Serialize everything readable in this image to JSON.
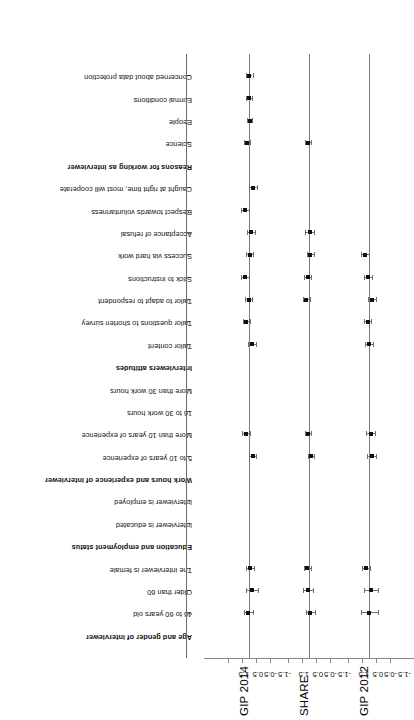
{
  "figure": {
    "orientation": "rotated-90",
    "panels": [
      {
        "title": "GIP 2014"
      },
      {
        "title": "SHARE"
      },
      {
        "title": "GIP 2012"
      }
    ],
    "axis_ticks": [
      "-1.5",
      "-0.5",
      "0.5",
      "1.5"
    ]
  },
  "legend": {
    "groups": [
      {
        "header": "Age and gender of interviewer",
        "items": [
          "46 to 60 years old",
          "Older than 60",
          "The interviewer is female"
        ]
      },
      {
        "header": "Education and employment status",
        "items": [
          "Interviewer is educated",
          "Interviewer is employed"
        ]
      },
      {
        "header": "Work hours and experience of interviewer",
        "items": [
          "5 to 10 years of experience",
          "More than 10 years of experience",
          "16 to 30 work hours",
          "More than 30 work hours"
        ]
      },
      {
        "header": "Interviewers attitudes",
        "items": [
          "Tailor content",
          "Tailor questions to shorten survey",
          "Tailor to adapt to respondent",
          "Stick to instructions",
          "Success via hard work",
          "Acceptance of refusal",
          "Respect towards voluntariness",
          "Caught at right time, most will cooperate"
        ]
      },
      {
        "header": "Reasons for working as interviewer",
        "items": [
          "Science",
          "People",
          "Formal conditions",
          "Concerned about data protection"
        ]
      }
    ]
  },
  "chart_data": {
    "type": "scatter",
    "title": "",
    "xlabel": "",
    "ylabel": "",
    "ylim": [
      -2.0,
      2.0
    ],
    "yticks": [
      -1.5,
      -0.5,
      0.5,
      1.5
    ],
    "grid": false,
    "legend_position": "none",
    "categories": [
      "46 to 60 years old",
      "Older than 60",
      "The interviewer is female",
      "Interviewer is educated",
      "Interviewer is employed",
      "5 to 10 years of experience",
      "More than 10 years of experience",
      "16 to 30 work hours",
      "More than 30 work hours",
      "Tailor content",
      "Tailor questions to shorten survey",
      "Tailor to adapt to respondent",
      "Stick to instructions",
      "Success via hard work",
      "Acceptance of refusal",
      "Respect towards voluntariness",
      "Caught at right time, most will cooperate",
      "Science",
      "People",
      "Formal conditions",
      "Concerned about data protection"
    ],
    "series": [
      {
        "name": "GIP 2014",
        "values": [
          0.05,
          -0.22,
          -0.09,
          null,
          null,
          -0.25,
          0.22,
          null,
          null,
          -0.24,
          0.18,
          0.02,
          0.3,
          -0.06,
          -0.12,
          0.26,
          -0.3,
          0.12,
          -0.04,
          -0.02,
          -0.03
        ],
        "ci_low": [
          -0.28,
          -0.62,
          -0.38,
          null,
          null,
          -0.52,
          -0.05,
          null,
          null,
          -0.52,
          -0.08,
          -0.24,
          0.02,
          -0.3,
          -0.4,
          -0.02,
          -0.6,
          -0.1,
          -0.22,
          -0.22,
          -0.25
        ],
        "ci_high": [
          0.38,
          0.18,
          0.2,
          null,
          null,
          0.02,
          0.49,
          null,
          null,
          0.04,
          0.44,
          0.28,
          0.58,
          0.18,
          0.16,
          0.54,
          0.0,
          0.34,
          0.14,
          0.18,
          0.19
        ]
      },
      {
        "name": "SHARE",
        "values": [
          -0.08,
          0.06,
          0.12,
          null,
          null,
          -0.12,
          0.06,
          null,
          null,
          null,
          null,
          0.18,
          0.1,
          -0.1,
          -0.06,
          null,
          null,
          0.08,
          null,
          null,
          null
        ],
        "ci_low": [
          -0.4,
          -0.28,
          -0.12,
          null,
          null,
          -0.34,
          -0.16,
          null,
          null,
          null,
          null,
          -0.06,
          -0.14,
          -0.36,
          -0.38,
          null,
          null,
          -0.12,
          null,
          null,
          null
        ],
        "ci_high": [
          0.24,
          0.4,
          0.36,
          null,
          null,
          0.1,
          0.28,
          null,
          null,
          null,
          null,
          0.42,
          0.34,
          0.16,
          0.26,
          null,
          null,
          0.28,
          null,
          null,
          null
        ]
      },
      {
        "name": "GIP 2012",
        "values": [
          -0.02,
          -0.14,
          0.22,
          null,
          null,
          -0.18,
          -0.14,
          null,
          null,
          -0.02,
          0.1,
          -0.2,
          0.08,
          0.3,
          null,
          null,
          null,
          null,
          null,
          null,
          null
        ],
        "ci_low": [
          -0.62,
          -0.66,
          -0.06,
          null,
          null,
          -0.48,
          -0.46,
          null,
          null,
          -0.3,
          -0.14,
          -0.48,
          -0.22,
          0.02,
          null,
          null,
          null,
          null,
          null,
          null,
          null
        ],
        "ci_high": [
          0.58,
          0.38,
          0.5,
          null,
          null,
          0.12,
          0.18,
          null,
          null,
          0.26,
          0.34,
          0.08,
          0.38,
          0.58,
          null,
          null,
          null,
          null,
          null,
          null,
          null
        ]
      }
    ]
  }
}
